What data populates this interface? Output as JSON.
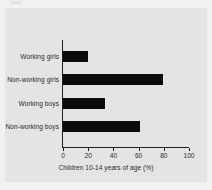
{
  "figure": {
    "background_color": "#e4e4e4",
    "page_color": "#f1f1f1",
    "bar_color": "#0b0b0b",
    "axis_color": "#1d1d1d",
    "text_color": "#2a2a2a"
  },
  "chart_data": {
    "type": "bar",
    "orientation": "horizontal",
    "title": "",
    "subtitle": "",
    "xlabel": "Children 10-14 years of age (%)",
    "ylabel": "",
    "categories": [
      "Working girls",
      "Non-working girls",
      "Working boys",
      "Non-working boys"
    ],
    "values": [
      20,
      79,
      33,
      61
    ],
    "series": [
      {
        "name": "Children 10-14 years of age (%)",
        "values": [
          20,
          79,
          33,
          61
        ]
      }
    ],
    "xlim": [
      0,
      100
    ],
    "xticks": [
      0,
      20,
      40,
      60,
      80,
      100
    ],
    "xtick_labels": [
      "0",
      "20",
      "40",
      "60",
      "80",
      "100"
    ],
    "grid": false,
    "legend": false,
    "legend_position": "none",
    "annotations": []
  }
}
